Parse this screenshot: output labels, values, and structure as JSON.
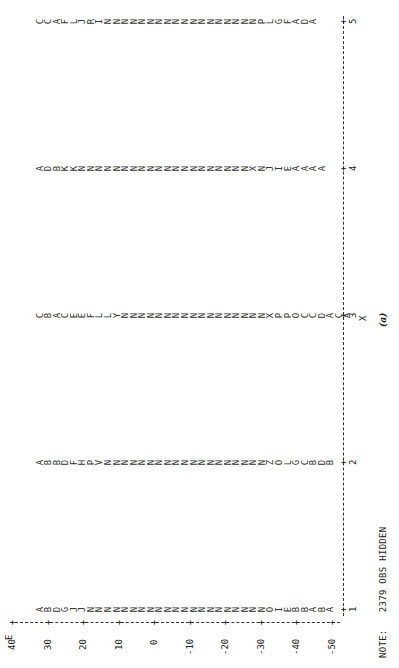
{
  "chart_data": {
    "type": "scatter",
    "title": "",
    "subtitle": "(a)",
    "xlabel": "X",
    "ylabel": "E",
    "xlim": [
      1,
      5
    ],
    "ylim": [
      -50,
      40
    ],
    "x_ticks": [
      "1",
      "2",
      "3",
      "4",
      "5"
    ],
    "y_ticks": [
      "40",
      "30",
      "20",
      "10",
      "0",
      "-10",
      "-20",
      "-30",
      "-40",
      "-50"
    ],
    "grid": false,
    "legend": "none (plot symbols A=1 obs, B=2 obs, etc.)",
    "orientation": "page rotated 90 degrees",
    "note": "NOTE:   2379 OBS HIDDEN",
    "series": [
      {
        "x": 1,
        "symbols_top_to_bottom": "AB DGJJ NNNNNNNNNNNNNNNNNNNNNOIEBBABA"
      },
      {
        "x": 2,
        "symbols_top_to_bottom": "AB BDFH PVNNNNNNNNNNNNNNNNNNNZOLGCBDB"
      },
      {
        "x": 3,
        "symbols_top_to_bottom": "CBACEEFL LYNNNNNNNNNNNNNNNNNXPPOCCDAC A"
      },
      {
        "x": 4,
        "symbols_top_to_bottom": "AD BKK NNNNNNNNNNNNNNNNNNNNXNJIEAA A A"
      },
      {
        "x": 5,
        "symbols_top_to_bottom": "C CAFLJ RINNNNNNNNNNNNNNNNNNPLGFAD A"
      }
    ]
  },
  "axis": {
    "y_name": "E",
    "x_name": "X",
    "y_ticks": [
      "40",
      "30",
      "20",
      "10",
      "0",
      "-10",
      "-20",
      "-30",
      "-40",
      "-50"
    ],
    "x_ticks": [
      "1",
      "2",
      "3",
      "4",
      "5"
    ]
  },
  "columns": [
    "AB DGJJ NNNNNNNNNNNNNNNNNNNNNOIEBBABA",
    "AB BDFH PVNNNNNNNNNNNNNNNNNNNZOLGCBDB",
    "CBACEEFL LYNNNNNNNNNNNNNNNNNXPPOCCDAC A",
    "AD BKK NNNNNNNNNNNNNNNNNNNNXNJIEAA A A",
    "C CAFLJ RINNNNNNNNNNNNNNNNNNPLGFAD A"
  ],
  "caption": "(a)",
  "note": "NOTE:   2379 OBS HIDDEN"
}
